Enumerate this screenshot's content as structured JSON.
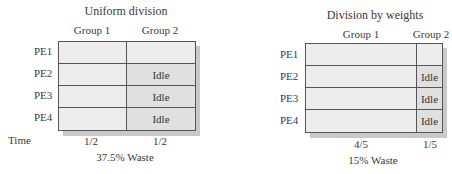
{
  "left": {
    "title": "Uniform division",
    "groups": [
      "Group 1",
      "Group 2"
    ],
    "rows": [
      {
        "label": "PE1",
        "g1": "",
        "g2": ""
      },
      {
        "label": "PE2",
        "g1": "",
        "g2": "Idle"
      },
      {
        "label": "PE3",
        "g1": "",
        "g2": "Idle"
      },
      {
        "label": "PE4",
        "g1": "",
        "g2": "Idle"
      }
    ],
    "time_label": "Time",
    "times": [
      "1/2",
      "1/2"
    ],
    "waste": "37.5% Waste"
  },
  "right": {
    "title": "Division by weights",
    "groups": [
      "Group 1",
      "Group 2"
    ],
    "rows": [
      {
        "label": "PE1",
        "g1": "",
        "g2": ""
      },
      {
        "label": "PE2",
        "g1": "",
        "g2": "Idle"
      },
      {
        "label": "PE3",
        "g1": "",
        "g2": "Idle"
      },
      {
        "label": "PE4",
        "g1": "",
        "g2": "Idle"
      }
    ],
    "times": [
      "4/5",
      "1/5"
    ],
    "waste": "15% Waste"
  }
}
